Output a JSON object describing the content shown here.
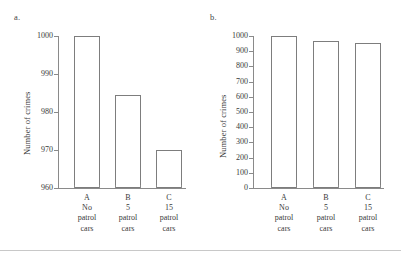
{
  "figure": {
    "panels": [
      {
        "key": "a",
        "label": "a.",
        "ylabel": "Number of crimes"
      },
      {
        "key": "b",
        "label": "b.",
        "ylabel": "Number of crimes"
      }
    ],
    "footer_rule_color": "#c8c8c8",
    "axis_color": "#8a8a8a",
    "bar_outline_color": "#7d7d7d",
    "bar_fill_color": "#ffffff",
    "background_color": "#ffffff"
  },
  "chart_data": [
    {
      "type": "bar",
      "title": "a.",
      "xlabel": "",
      "ylabel": "Number of crimes",
      "categories": [
        "A",
        "B",
        "C"
      ],
      "category_lines": [
        [
          "A",
          "No",
          "patrol",
          "cars"
        ],
        [
          "B",
          "5",
          "patrol",
          "cars"
        ],
        [
          "C",
          "15",
          "patrol",
          "cars"
        ]
      ],
      "values": [
        1000,
        984.5,
        970
      ],
      "ylim": [
        960,
        1000
      ],
      "yticks": [
        960,
        970,
        980,
        990,
        1000
      ],
      "ytick_labels": [
        "960",
        "970",
        "980",
        "990",
        "1000"
      ],
      "grid": false,
      "legend": false
    },
    {
      "type": "bar",
      "title": "b.",
      "xlabel": "",
      "ylabel": "Number of crimes",
      "categories": [
        "A",
        "B",
        "C"
      ],
      "category_lines": [
        [
          "A",
          "No",
          "patrol",
          "cars"
        ],
        [
          "B",
          "5",
          "patrol",
          "cars"
        ],
        [
          "C",
          "15",
          "patrol",
          "cars"
        ]
      ],
      "values": [
        1000,
        970,
        955
      ],
      "ylim": [
        0,
        1000
      ],
      "yticks": [
        0,
        100,
        200,
        300,
        400,
        500,
        600,
        700,
        800,
        900,
        1000
      ],
      "ytick_labels": [
        "0",
        "100",
        "200",
        "300",
        "400",
        "500",
        "600",
        "700",
        "800",
        "900",
        "1000"
      ],
      "grid": false,
      "legend": false
    }
  ]
}
